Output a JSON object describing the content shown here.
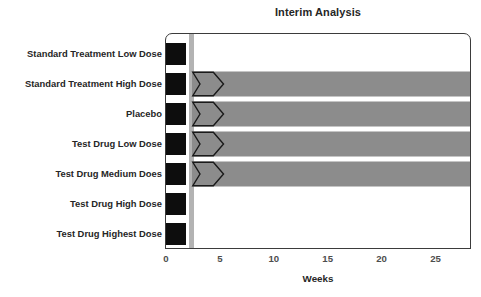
{
  "chart_data": {
    "type": "bar",
    "title": "Interim Analysis",
    "xlabel": "Weeks",
    "ylabel": "",
    "orientation": "horizontal",
    "xlim": [
      0,
      28.3
    ],
    "grid": false,
    "legend": false,
    "xticks": [
      0,
      5,
      10,
      15,
      20,
      25
    ],
    "xticklabels": [
      "0",
      "5",
      "10",
      "15",
      "20",
      "25"
    ],
    "categories": [
      "Standard Treatment Low Dose",
      "Standard Treatment High Dose",
      "Placebo",
      "Test Drug Low Dose",
      "Test Drug Medium Does",
      "Test Drug High Dose",
      "Test Drug Highest Dose"
    ],
    "series": [
      {
        "name": "Enrollment Block",
        "color": "#0d0d0d",
        "start_week": 0,
        "end_week": 1.75,
        "values": [
          1.75,
          1.75,
          1.75,
          1.75,
          1.75,
          1.75,
          1.75
        ]
      },
      {
        "name": "Treatment Duration",
        "color": "#8c8c8c",
        "start_week": 2.3,
        "values": [
          0,
          28.3,
          28.3,
          28.3,
          28.3,
          0,
          0
        ]
      },
      {
        "name": "Dose Escalation Marker",
        "color": "#8c8c8c",
        "shape": "chevron",
        "start_week": 2.3,
        "end_week": 5.3,
        "present": [
          false,
          true,
          true,
          true,
          true,
          false,
          false
        ]
      }
    ],
    "annotations": [
      {
        "name": "interim-analysis-marker",
        "type": "vline",
        "week": 2.05,
        "color": "#b3b3b3",
        "label": "Interim Analysis"
      }
    ]
  },
  "chart": {
    "title": "Interim Analysis",
    "x_axis_title": "Weeks",
    "tick_labels": [
      "0",
      "5",
      "10",
      "15",
      "20",
      "25"
    ],
    "rows": [
      {
        "label": "Standard Treatment Low Dose",
        "bar": false,
        "chevron": false
      },
      {
        "label": "Standard Treatment High Dose",
        "bar": true,
        "chevron": true
      },
      {
        "label": "Placebo",
        "bar": true,
        "chevron": true
      },
      {
        "label": "Test Drug Low Dose",
        "bar": true,
        "chevron": true
      },
      {
        "label": "Test Drug Medium Does",
        "bar": true,
        "chevron": true
      },
      {
        "label": "Test Drug High Dose",
        "bar": false,
        "chevron": false
      },
      {
        "label": "Test Drug Highest Dose",
        "bar": false,
        "chevron": false
      }
    ],
    "colors": {
      "block": "#0d0d0d",
      "bar": "#8c8c8c",
      "marker": "#b3b3b3",
      "axis": "#3b3b3b",
      "text": "#262626"
    }
  }
}
